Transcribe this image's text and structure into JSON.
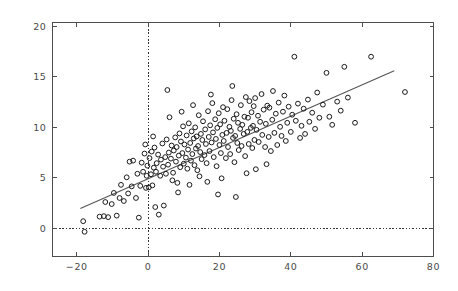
{
  "chart_data": {
    "type": "scatter",
    "title": "",
    "subtitle": "",
    "xlabel": "",
    "ylabel": "",
    "xlim": [
      -26.8,
      80.0
    ],
    "ylim": [
      -2.75,
      20.39
    ],
    "grid": false,
    "legend": null,
    "xticks": [
      -20,
      0,
      20,
      40,
      60,
      80
    ],
    "xtick_labels": [
      "−20",
      "0",
      "20",
      "40",
      "60",
      "80"
    ],
    "yticks": [
      0,
      5,
      10,
      15,
      20
    ],
    "ytick_labels": [
      "0",
      "5",
      "10",
      "15",
      "20"
    ],
    "marker": "open-circle",
    "marker_radius_px": 2.4,
    "marker_color": "#1a1a1a",
    "background_color": "#ffffff",
    "frame_color": "#4d4d4d",
    "reference_lines": [
      {
        "name": "x-zero-line",
        "orientation": "vertical",
        "value": 0,
        "style": "dotted"
      },
      {
        "name": "y-zero-line",
        "orientation": "horizontal",
        "value": 0,
        "style": "dotted"
      }
    ],
    "fit_line": {
      "name": "regression-line",
      "x_start": -19.0,
      "y_start": 1.95,
      "x_end": 69.0,
      "y_end": 15.6,
      "slope": 0.1551,
      "intercept": 4.897,
      "color": "#555555"
    },
    "series": [
      {
        "name": "observations",
        "color": "#1a1a1a",
        "points": [
          [
            -18.2,
            0.7
          ],
          [
            -17.8,
            -0.35
          ],
          [
            -13.6,
            1.15
          ],
          [
            -12.4,
            1.2
          ],
          [
            -12.0,
            2.6
          ],
          [
            -11.2,
            1.1
          ],
          [
            -10.2,
            2.4
          ],
          [
            -9.6,
            3.5
          ],
          [
            -8.8,
            1.25
          ],
          [
            -8.0,
            3.0
          ],
          [
            -7.6,
            4.3
          ],
          [
            -6.8,
            2.7
          ],
          [
            -6.0,
            5.05
          ],
          [
            -5.6,
            3.45
          ],
          [
            -5.2,
            6.6
          ],
          [
            -4.6,
            4.15
          ],
          [
            -4.2,
            6.7
          ],
          [
            -3.4,
            3.0
          ],
          [
            -3.0,
            5.4
          ],
          [
            -2.6,
            1.05
          ],
          [
            -2.2,
            4.2
          ],
          [
            -1.8,
            6.5
          ],
          [
            -1.4,
            5.6
          ],
          [
            -1.0,
            7.4
          ],
          [
            -0.6,
            4.0
          ],
          [
            -0.4,
            5.2
          ],
          [
            -0.2,
            6.2
          ],
          [
            0.2,
            4.05
          ],
          [
            0.4,
            6.95
          ],
          [
            0.8,
            5.35
          ],
          [
            1.0,
            7.6
          ],
          [
            1.2,
            4.25
          ],
          [
            1.6,
            6.0
          ],
          [
            1.8,
            8.0
          ],
          [
            2.2,
            5.6
          ],
          [
            2.4,
            6.45
          ],
          [
            2.8,
            7.3
          ],
          [
            3.0,
            1.35
          ],
          [
            3.4,
            5.2
          ],
          [
            3.6,
            6.8
          ],
          [
            4.0,
            8.4
          ],
          [
            4.2,
            6.1
          ],
          [
            4.4,
            2.25
          ],
          [
            4.8,
            7.05
          ],
          [
            5.0,
            5.4
          ],
          [
            5.2,
            8.8
          ],
          [
            5.6,
            6.3
          ],
          [
            5.8,
            7.5
          ],
          [
            6.0,
            11.0
          ],
          [
            6.4,
            6.9
          ],
          [
            6.6,
            8.2
          ],
          [
            7.0,
            5.5
          ],
          [
            7.2,
            7.7
          ],
          [
            7.6,
            9.0
          ],
          [
            7.8,
            6.6
          ],
          [
            8.0,
            8.05
          ],
          [
            8.2,
            4.5
          ],
          [
            8.6,
            7.2
          ],
          [
            8.8,
            9.4
          ],
          [
            9.0,
            6.05
          ],
          [
            9.2,
            8.6
          ],
          [
            9.6,
            7.45
          ],
          [
            9.8,
            10.1
          ],
          [
            10.0,
            6.4
          ],
          [
            10.2,
            8.3
          ],
          [
            10.6,
            7.0
          ],
          [
            10.8,
            9.2
          ],
          [
            11.0,
            5.9
          ],
          [
            11.2,
            7.8
          ],
          [
            11.4,
            10.4
          ],
          [
            11.8,
            8.45
          ],
          [
            12.0,
            6.7
          ],
          [
            12.2,
            9.6
          ],
          [
            12.4,
            7.35
          ],
          [
            12.8,
            8.9
          ],
          [
            13.0,
            6.25
          ],
          [
            13.2,
            10.0
          ],
          [
            13.4,
            7.9
          ],
          [
            13.6,
            9.1
          ],
          [
            13.8,
            5.75
          ],
          [
            14.0,
            8.15
          ],
          [
            14.2,
            11.2
          ],
          [
            14.6,
            7.55
          ],
          [
            14.8,
            9.35
          ],
          [
            15.0,
            6.85
          ],
          [
            15.2,
            8.75
          ],
          [
            15.4,
            10.6
          ],
          [
            15.8,
            7.25
          ],
          [
            16.0,
            9.8
          ],
          [
            16.2,
            8.35
          ],
          [
            16.4,
            6.45
          ],
          [
            16.8,
            11.6
          ],
          [
            17.0,
            9.05
          ],
          [
            17.2,
            7.65
          ],
          [
            17.4,
            10.2
          ],
          [
            17.8,
            8.5
          ],
          [
            18.0,
            12.4
          ],
          [
            18.2,
            9.5
          ],
          [
            18.4,
            7.05
          ],
          [
            18.8,
            10.8
          ],
          [
            19.0,
            8.85
          ],
          [
            19.2,
            6.15
          ],
          [
            19.4,
            9.95
          ],
          [
            19.8,
            11.4
          ],
          [
            20.0,
            8.25
          ],
          [
            20.2,
            10.3
          ],
          [
            20.4,
            7.45
          ],
          [
            20.8,
            9.25
          ],
          [
            21.0,
            12.0
          ],
          [
            21.2,
            8.65
          ],
          [
            21.4,
            10.65
          ],
          [
            21.8,
            6.95
          ],
          [
            22.0,
            9.45
          ],
          [
            22.2,
            11.8
          ],
          [
            22.4,
            8.05
          ],
          [
            22.8,
            10.05
          ],
          [
            23.0,
            7.35
          ],
          [
            23.2,
            9.65
          ],
          [
            23.4,
            12.7
          ],
          [
            23.8,
            8.95
          ],
          [
            24.0,
            10.85
          ],
          [
            24.2,
            6.55
          ],
          [
            24.4,
            9.15
          ],
          [
            24.8,
            11.3
          ],
          [
            25.0,
            8.45
          ],
          [
            25.2,
            10.45
          ],
          [
            25.4,
            7.75
          ],
          [
            25.8,
            9.85
          ],
          [
            26.0,
            12.2
          ],
          [
            26.2,
            8.15
          ],
          [
            26.4,
            10.25
          ],
          [
            26.8,
            9.35
          ],
          [
            27.0,
            11.05
          ],
          [
            27.2,
            7.15
          ],
          [
            27.4,
            13.0
          ],
          [
            27.8,
            9.55
          ],
          [
            28.0,
            10.95
          ],
          [
            28.2,
            8.35
          ],
          [
            28.4,
            12.6
          ],
          [
            28.8,
            9.95
          ],
          [
            29.0,
            11.5
          ],
          [
            29.2,
            7.95
          ],
          [
            29.4,
            10.15
          ],
          [
            29.8,
            8.75
          ],
          [
            30.0,
            12.9
          ],
          [
            30.4,
            9.75
          ],
          [
            30.8,
            11.15
          ],
          [
            31.0,
            8.55
          ],
          [
            31.4,
            10.55
          ],
          [
            31.8,
            13.3
          ],
          [
            32.0,
            9.25
          ],
          [
            32.4,
            11.75
          ],
          [
            32.8,
            8.05
          ],
          [
            33.0,
            10.35
          ],
          [
            33.4,
            12.15
          ],
          [
            33.8,
            9.05
          ],
          [
            34.0,
            11.95
          ],
          [
            34.4,
            7.65
          ],
          [
            34.8,
            10.75
          ],
          [
            35.0,
            13.6
          ],
          [
            35.4,
            9.45
          ],
          [
            35.8,
            11.35
          ],
          [
            36.2,
            8.25
          ],
          [
            36.6,
            12.45
          ],
          [
            37.0,
            10.05
          ],
          [
            37.4,
            9.15
          ],
          [
            37.8,
            11.55
          ],
          [
            38.2,
            13.15
          ],
          [
            38.6,
            8.65
          ],
          [
            39.0,
            10.45
          ],
          [
            39.4,
            12.05
          ],
          [
            40.0,
            9.55
          ],
          [
            40.4,
            11.25
          ],
          [
            41.0,
            17.0
          ],
          [
            41.4,
            10.65
          ],
          [
            42.0,
            12.35
          ],
          [
            42.6,
            8.95
          ],
          [
            43.0,
            10.15
          ],
          [
            43.6,
            11.85
          ],
          [
            44.0,
            9.35
          ],
          [
            44.8,
            12.75
          ],
          [
            45.2,
            10.55
          ],
          [
            46.0,
            11.45
          ],
          [
            46.8,
            9.85
          ],
          [
            47.4,
            13.45
          ],
          [
            48.0,
            10.95
          ],
          [
            49.0,
            12.25
          ],
          [
            50.0,
            15.4
          ],
          [
            50.8,
            11.05
          ],
          [
            51.6,
            10.25
          ],
          [
            53.0,
            12.55
          ],
          [
            54.0,
            11.65
          ],
          [
            55.0,
            16.0
          ],
          [
            56.0,
            12.95
          ],
          [
            58.0,
            10.45
          ],
          [
            62.5,
            17.0
          ],
          [
            72.0,
            13.5
          ],
          [
            5.4,
            13.7
          ],
          [
            2.0,
            2.1
          ],
          [
            11.6,
            4.3
          ],
          [
            16.6,
            4.6
          ],
          [
            20.6,
            4.95
          ],
          [
            24.6,
            3.1
          ],
          [
            19.6,
            3.35
          ],
          [
            8.4,
            3.55
          ],
          [
            14.4,
            5.15
          ],
          [
            30.2,
            5.85
          ],
          [
            33.2,
            6.35
          ],
          [
            27.6,
            5.45
          ],
          [
            6.8,
            4.75
          ],
          [
            -0.8,
            8.3
          ],
          [
            1.4,
            9.1
          ],
          [
            9.4,
            11.55
          ],
          [
            12.6,
            12.2
          ],
          [
            17.6,
            13.25
          ],
          [
            23.6,
            14.1
          ],
          [
            29.6,
            12.1
          ]
        ]
      }
    ]
  }
}
